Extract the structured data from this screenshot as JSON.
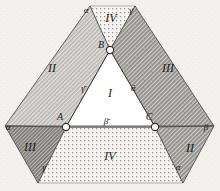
{
  "figure": {
    "background_color": "#f2f1ee",
    "line_color": "#2b2b2b",
    "regions": [
      {
        "id": "center",
        "label": "I",
        "fill": "#ffffff",
        "texture": "none",
        "x": 110,
        "y": 97
      },
      {
        "id": "left-upper",
        "label": "II",
        "fill": "#d8d6d2",
        "texture": "hatch-light",
        "x": 52,
        "y": 72
      },
      {
        "id": "right-upper",
        "label": "III",
        "fill": "#b9b7b3",
        "texture": "hatch-dark",
        "x": 168,
        "y": 72
      },
      {
        "id": "bottom-left",
        "label": "III",
        "fill": "#a9a7a3",
        "texture": "hatch-dark",
        "x": 30,
        "y": 151
      },
      {
        "id": "bottom-right",
        "label": "II",
        "fill": "#c6c4c0",
        "texture": "hatch-light",
        "x": 190,
        "y": 152
      },
      {
        "id": "top-notch",
        "label": "IV",
        "fill": "#f4f3f0",
        "texture": "dots",
        "x": 111,
        "y": 18
      },
      {
        "id": "bottom-square",
        "label": "IV",
        "fill": "#f4f3f0",
        "texture": "dots",
        "x": 110,
        "y": 156
      }
    ],
    "points": [
      {
        "id": "A",
        "label": "A",
        "cx": 66,
        "cy": 127,
        "label_x": 60,
        "label_y": 120
      },
      {
        "id": "B",
        "label": "B",
        "cx": 110,
        "cy": 50,
        "label_x": 101,
        "label_y": 48
      },
      {
        "id": "C",
        "label": "C",
        "cx": 155,
        "cy": 127,
        "label_x": 149,
        "label_y": 120
      }
    ],
    "greek_labels": [
      {
        "id": "alpha-top",
        "label": "α",
        "x": 86,
        "y": 13
      },
      {
        "id": "gamma-top",
        "label": "γ",
        "x": 131,
        "y": 13
      },
      {
        "id": "alpha-left",
        "label": "α",
        "x": 8,
        "y": 130
      },
      {
        "id": "beta-right",
        "label": "β",
        "x": 205,
        "y": 130
      },
      {
        "id": "gamma-bottom-left",
        "label": "γ",
        "x": 44,
        "y": 170
      },
      {
        "id": "alpha-bottom-right",
        "label": "α",
        "x": 178,
        "y": 170
      },
      {
        "id": "gamma-bar-left",
        "label": "γ̄",
        "x": 83,
        "y": 91
      },
      {
        "id": "alpha-bar-right",
        "label": "ᾱ",
        "x": 133,
        "y": 91
      },
      {
        "id": "beta-bar-bottom",
        "label": "β̄",
        "x": 106,
        "y": 124
      }
    ],
    "geometry": {
      "A": [
        66,
        127
      ],
      "B": [
        110,
        50
      ],
      "C": [
        155,
        127
      ],
      "alpha_top": [
        90,
        6
      ],
      "gamma_top": [
        135,
        6
      ],
      "alpha_left": [
        5,
        126
      ],
      "beta_right": [
        214,
        126
      ],
      "gamma_bottom": [
        38,
        183
      ],
      "alpha_bottom": [
        183,
        183
      ],
      "baseline_y": 127,
      "square_bottom_y": 183
    }
  }
}
